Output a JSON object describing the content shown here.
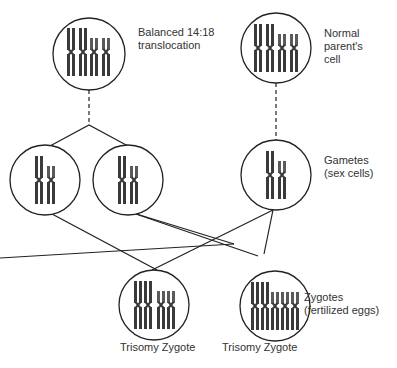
{
  "labels": {
    "balanced": "Balanced 14:18\ntranslocation",
    "normal": "Normal\nparent's\ncell",
    "gametes": "Gametes\n(sex cells)",
    "zygotes": "Zygotes\n(fertilized eggs)",
    "zygote1": "Trisomy Zygote",
    "zygote2": "Trisomy Zygote"
  },
  "colors": {
    "outline": "#222222",
    "chromosome_dark": "#3a3a3a",
    "chromosome_light": "#7a7a7a"
  },
  "nodes": [
    {
      "id": "balanced-parent",
      "cx": 89,
      "cy": 54,
      "r": 36
    },
    {
      "id": "normal-parent",
      "cx": 276,
      "cy": 48,
      "r": 35
    },
    {
      "id": "gamete-1",
      "cx": 45,
      "cy": 180,
      "r": 35
    },
    {
      "id": "gamete-2",
      "cx": 128,
      "cy": 180,
      "r": 35
    },
    {
      "id": "gamete-3",
      "cx": 276,
      "cy": 175,
      "r": 35
    },
    {
      "id": "zygote-1",
      "cx": 154,
      "cy": 305,
      "r": 35
    },
    {
      "id": "zygote-2",
      "cx": 275,
      "cy": 306,
      "r": 35
    }
  ]
}
